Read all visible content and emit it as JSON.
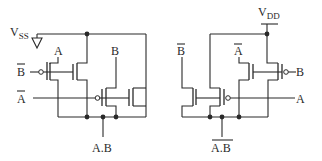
{
  "diagram": {
    "type": "cmos-logic-circuits",
    "left_circuit": {
      "supply_label": "V",
      "supply_subscript": "SS",
      "inputs": {
        "b_bar": "B",
        "a_bar": "A",
        "a": "A",
        "b": "B"
      },
      "output_label": "A.B",
      "output_inverted": false
    },
    "right_circuit": {
      "supply_label": "V",
      "supply_subscript": "DD",
      "inputs": {
        "b_bar": "B",
        "a_bar": "A",
        "a": "A",
        "b": "B"
      },
      "output_label": "A.B",
      "output_inverted": true
    }
  }
}
